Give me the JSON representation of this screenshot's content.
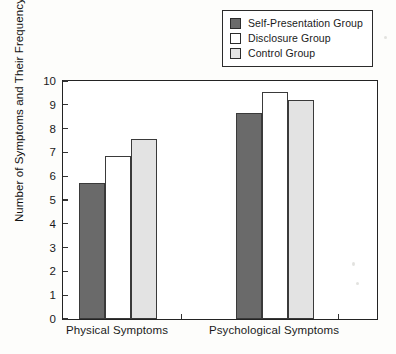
{
  "chart_data": {
    "type": "bar",
    "title": "",
    "xlabel": "",
    "ylabel": "Number of Symptoms and Their Frequency",
    "ylim": [
      0,
      10
    ],
    "yticks": [
      0,
      1,
      2,
      3,
      4,
      5,
      6,
      7,
      8,
      9,
      10
    ],
    "grid": false,
    "legend_position": "top-right",
    "categories": [
      "Physical Symptoms",
      "Psychological Symptoms"
    ],
    "series": [
      {
        "name": "Self-Presentation Group",
        "color": "#6a6a6a",
        "values": [
          5.7,
          8.65
        ]
      },
      {
        "name": "Disclosure Group",
        "color": "#ffffff",
        "values": [
          6.85,
          9.55
        ]
      },
      {
        "name": "Control Group",
        "color": "#e3e3e3",
        "values": [
          7.55,
          9.2
        ]
      }
    ]
  },
  "legend": {
    "items": [
      {
        "label": "Self-Presentation Group",
        "swatch": "#6a6a6a"
      },
      {
        "label": "Disclosure Group",
        "swatch": "#ffffff"
      },
      {
        "label": "Control Group",
        "swatch": "#e3e3e3"
      }
    ]
  },
  "axis": {
    "y_title": "Number of Symptoms and Their Frequency",
    "y_tick_labels": [
      "10",
      "9",
      "8",
      "7",
      "6",
      "5",
      "4",
      "3",
      "2",
      "1",
      "0"
    ],
    "x_tick_labels": [
      "Physical Symptoms",
      "Psychological Symptoms"
    ]
  }
}
